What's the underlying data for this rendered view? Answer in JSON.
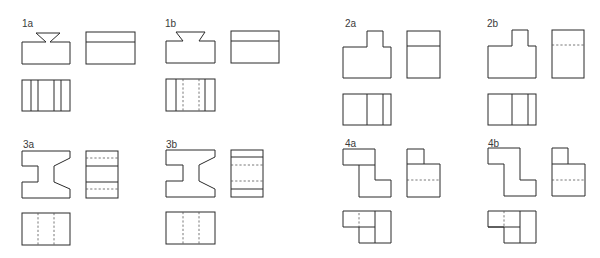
{
  "figure": {
    "line_color": "#2b2b2b",
    "hidden_line_color": "#555555",
    "panels": [
      {
        "id": "1a",
        "label": "1a",
        "views": [
          "front",
          "side",
          "top"
        ],
        "shape": "dovetail block",
        "hidden_lines": false
      },
      {
        "id": "1b",
        "label": "1b",
        "views": [
          "front",
          "side",
          "top"
        ],
        "shape": "dovetail block",
        "hidden_lines": true
      },
      {
        "id": "2a",
        "label": "2a",
        "views": [
          "front",
          "side",
          "top"
        ],
        "shape": "stepped block",
        "hidden_lines": false
      },
      {
        "id": "2b",
        "label": "2b",
        "views": [
          "front",
          "side",
          "top"
        ],
        "shape": "stepped block",
        "hidden_lines": true
      },
      {
        "id": "3a",
        "label": "3a",
        "views": [
          "front",
          "side",
          "top"
        ],
        "shape": "notched block",
        "hidden_lines": true
      },
      {
        "id": "3b",
        "label": "3b",
        "views": [
          "front",
          "side",
          "top"
        ],
        "shape": "notched block",
        "hidden_lines": true
      },
      {
        "id": "4a",
        "label": "4a",
        "views": [
          "front",
          "side",
          "top"
        ],
        "shape": "Z-shaped block",
        "hidden_lines": true
      },
      {
        "id": "4b",
        "label": "4b",
        "views": [
          "front",
          "side",
          "top"
        ],
        "shape": "Z-shaped block",
        "hidden_lines": true
      }
    ]
  }
}
